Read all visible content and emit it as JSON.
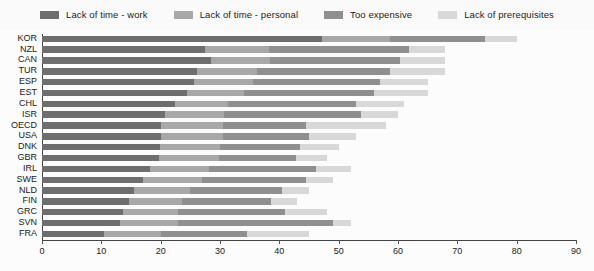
{
  "legend": {
    "position": "top-center",
    "items": [
      {
        "label": "Lack of time - work",
        "color": "#6e6e6e"
      },
      {
        "label": "Lack of time - personal",
        "color": "#a8a8a8"
      },
      {
        "label": "Too expensive",
        "color": "#8f8f8f"
      },
      {
        "label": "Lack of prerequisites",
        "color": "#d8d8d8"
      }
    ]
  },
  "chart_data": {
    "type": "bar",
    "orientation": "horizontal",
    "stacked": true,
    "title": "",
    "subtitle": "",
    "xlabel": "",
    "ylabel": "",
    "xlim": [
      0,
      90
    ],
    "xticks": [
      0,
      10,
      20,
      30,
      40,
      50,
      60,
      70,
      80,
      90
    ],
    "grid": false,
    "categories": [
      "KOR",
      "NZL",
      "CAN",
      "TUR",
      "ESP",
      "EST",
      "CHL",
      "ISR",
      "OECD",
      "USA",
      "DNK",
      "GBR",
      "IRL",
      "SWE",
      "NLD",
      "FIN",
      "GRC",
      "SVN",
      "FRA"
    ],
    "series": [
      {
        "name": "Lack of time - work",
        "color": "#6e6e6e",
        "values": [
          47.2,
          27.5,
          28.4,
          26.2,
          25.7,
          24.5,
          22.4,
          20.7,
          20.0,
          20.0,
          19.9,
          19.8,
          18.2,
          17.0,
          15.5,
          14.6,
          13.6,
          13.1,
          10.5
        ]
      },
      {
        "name": "Lack of time - personal",
        "color": "#a8a8a8",
        "values": [
          11.5,
          10.8,
          10.0,
          10.0,
          9.8,
          9.5,
          9.0,
          10.0,
          10.5,
          10.5,
          10.1,
          10.0,
          10.0,
          10.0,
          9.5,
          9.0,
          9.4,
          9.9,
          9.5
        ]
      },
      {
        "name": "Too expensive",
        "color": "#8f8f8f",
        "values": [
          16.0,
          23.5,
          22.0,
          22.5,
          21.5,
          22.0,
          21.5,
          23.0,
          14.0,
          14.5,
          13.5,
          13.0,
          18.0,
          17.5,
          15.5,
          15.0,
          18.0,
          26.0,
          14.5
        ]
      },
      {
        "name": "Lack of prerequisites",
        "color": "#d8d8d8",
        "values": [
          5.3,
          6.2,
          7.6,
          9.3,
          8.0,
          9.0,
          8.1,
          6.3,
          13.5,
          8.0,
          6.5,
          5.2,
          5.8,
          4.5,
          4.5,
          4.4,
          7.0,
          3.0,
          10.5
        ]
      }
    ],
    "totals": [
      80.0,
      68.0,
      68.0,
      68.0,
      65.0,
      65.0,
      61.0,
      60.0,
      58.0,
      53.0,
      50.0,
      48.0,
      52.0,
      49.0,
      45.0,
      43.0,
      48.0,
      52.0,
      45.0
    ]
  }
}
